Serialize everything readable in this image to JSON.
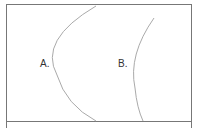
{
  "diagram": {
    "labels": {
      "a": "A.",
      "b": "B."
    },
    "colors": {
      "border": "#777777",
      "arc": "#aaaaaa",
      "text": "#333333"
    }
  }
}
